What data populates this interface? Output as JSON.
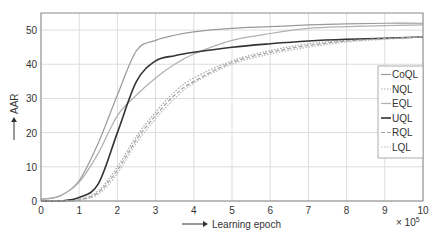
{
  "chart_data": {
    "type": "line",
    "title": "",
    "xlabel": "Learning epoch",
    "ylabel": "AAR",
    "x_multiplier": "× 10^5",
    "xlim": [
      0,
      10
    ],
    "ylim": [
      0,
      55
    ],
    "xticks": [
      0,
      1,
      2,
      3,
      4,
      5,
      6,
      7,
      8,
      9,
      10
    ],
    "yticks": [
      0,
      10,
      20,
      30,
      40,
      50
    ],
    "grid": true,
    "legend_position": "right-middle",
    "x": [
      0,
      0.5,
      1,
      1.5,
      2,
      2.5,
      3,
      3.5,
      4,
      5,
      6,
      7,
      8,
      9,
      10
    ],
    "series": [
      {
        "name": "CoQL",
        "style": "solid",
        "color": "#9a9a9a",
        "values": [
          0.5,
          1.5,
          6,
          17,
          31,
          44,
          47,
          48.5,
          49.5,
          50.5,
          51,
          51.5,
          51.8,
          52,
          52
        ]
      },
      {
        "name": "NQL",
        "style": "dotted",
        "color": "#a8a8a8",
        "values": [
          0,
          0,
          0.5,
          3,
          10,
          19,
          26,
          32,
          36,
          41,
          44,
          46,
          47,
          47.5,
          48
        ]
      },
      {
        "name": "EQL",
        "style": "solid",
        "color": "#b0b0b0",
        "values": [
          0.5,
          1.5,
          5.5,
          14,
          25,
          31,
          36,
          40,
          43,
          47,
          49,
          50.5,
          51,
          51.3,
          51.5
        ]
      },
      {
        "name": "UQL",
        "style": "solid",
        "color": "#333333",
        "values": [
          0,
          0,
          1,
          5,
          20,
          35,
          41,
          42.5,
          43.5,
          45,
          46,
          46.8,
          47.3,
          47.6,
          48
        ]
      },
      {
        "name": "RQL",
        "style": "dashed",
        "color": "#a0a0a0",
        "values": [
          0,
          0,
          0.3,
          2.5,
          9,
          18,
          25,
          31,
          35,
          40.5,
          43.5,
          45.5,
          46.8,
          47.5,
          48
        ]
      },
      {
        "name": "LQL",
        "style": "dotted",
        "color": "#b8b8b8",
        "values": [
          0,
          0,
          0.3,
          2,
          8,
          17,
          24,
          30,
          34.5,
          40,
          43,
          45,
          46.5,
          47.3,
          48
        ]
      }
    ]
  },
  "axes": {
    "xlabel": "Learning epoch",
    "ylabel": "AAR",
    "multiplier_base": "× 10",
    "multiplier_exp": "5",
    "xticks": [
      "0",
      "1",
      "2",
      "3",
      "4",
      "5",
      "6",
      "7",
      "8",
      "9",
      "10"
    ],
    "yticks": [
      "0",
      "10",
      "20",
      "30",
      "40",
      "50"
    ]
  },
  "legend": [
    "CoQL",
    "NQL",
    "EQL",
    "UQL",
    "RQL",
    "LQL"
  ]
}
